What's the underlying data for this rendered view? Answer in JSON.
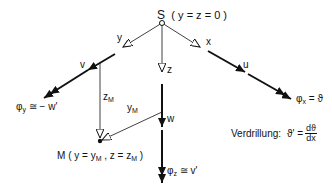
{
  "diagram": {
    "origin": {
      "label": "S",
      "condition": "( y = z = 0 )"
    },
    "axes": {
      "x": {
        "label": "x",
        "displacement": "u",
        "rotation": "φx = ϑ",
        "rotation_symbol": "φ",
        "rotation_sub": "x",
        "rotation_rhs": "= ϑ"
      },
      "y": {
        "label": "y",
        "displacement": "v",
        "rotation": "φy ≅ − w'",
        "rotation_symbol": "φ",
        "rotation_sub": "y",
        "rotation_rhs": "≅ − w'"
      },
      "z": {
        "label": "z",
        "displacement": "w",
        "rotation": "φz ≅ v'",
        "rotation_symbol": "φ",
        "rotation_sub": "z",
        "rotation_rhs": "≅ v'"
      }
    },
    "shear_center": {
      "label": "M",
      "condition_prefix": "( y = y",
      "sub_M": "M",
      "condition_mid": " , z = z",
      "condition_suffix": " )"
    },
    "offsets": {
      "z_M": "z",
      "z_M_sub": "M",
      "y_M": "y",
      "y_M_sub": "M"
    },
    "twist": {
      "label": "Verdrillung:",
      "lhs": "ϑ' =",
      "numerator": "dϑ",
      "denominator": "dx"
    }
  }
}
